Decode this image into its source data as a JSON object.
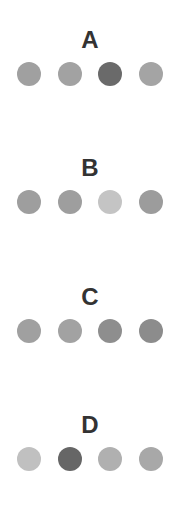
{
  "groups": [
    {
      "label": "A",
      "dots": [
        {
          "shade": "medium",
          "color": "#a0a0a0"
        },
        {
          "shade": "medium",
          "color": "#a2a2a2"
        },
        {
          "shade": "dark",
          "color": "#6a6a6a"
        },
        {
          "shade": "medium",
          "color": "#a4a4a4"
        }
      ]
    },
    {
      "label": "B",
      "dots": [
        {
          "shade": "medium",
          "color": "#9e9e9e"
        },
        {
          "shade": "medium",
          "color": "#9e9e9e"
        },
        {
          "shade": "light",
          "color": "#c4c4c4"
        },
        {
          "shade": "medium",
          "color": "#9c9c9c"
        }
      ]
    },
    {
      "label": "C",
      "dots": [
        {
          "shade": "medium",
          "color": "#a0a0a0"
        },
        {
          "shade": "medium",
          "color": "#a2a2a2"
        },
        {
          "shade": "medium-dark",
          "color": "#8e8e8e"
        },
        {
          "shade": "medium-dark",
          "color": "#8c8c8c"
        }
      ]
    },
    {
      "label": "D",
      "dots": [
        {
          "shade": "light",
          "color": "#c0c0c0"
        },
        {
          "shade": "dark",
          "color": "#666666"
        },
        {
          "shade": "light-medium",
          "color": "#b0b0b0"
        },
        {
          "shade": "light-medium",
          "color": "#a8a8a8"
        }
      ]
    }
  ]
}
